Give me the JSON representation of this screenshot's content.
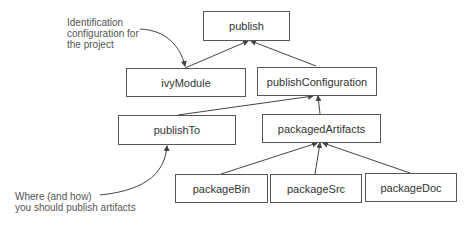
{
  "diagram": {
    "nodes": [
      {
        "id": "publish",
        "label": "publish"
      },
      {
        "id": "ivyModule",
        "label": "ivyModule"
      },
      {
        "id": "publishConfiguration",
        "label": "publishConfiguration"
      },
      {
        "id": "publishTo",
        "label": "publishTo"
      },
      {
        "id": "packagedArtifacts",
        "label": "packagedArtifacts"
      },
      {
        "id": "packageBin",
        "label": "packageBin"
      },
      {
        "id": "packageSrc",
        "label": "packageSrc"
      },
      {
        "id": "packageDoc",
        "label": "packageDoc"
      }
    ],
    "edges": [
      {
        "from": "ivyModule",
        "to": "publish"
      },
      {
        "from": "publishConfiguration",
        "to": "publish"
      },
      {
        "from": "publishTo",
        "to": "publishConfiguration"
      },
      {
        "from": "packagedArtifacts",
        "to": "publishConfiguration"
      },
      {
        "from": "packageBin",
        "to": "packagedArtifacts"
      },
      {
        "from": "packageSrc",
        "to": "packagedArtifacts"
      },
      {
        "from": "packageDoc",
        "to": "packagedArtifacts"
      }
    ],
    "annotations": [
      {
        "target": "ivyModule",
        "lines": [
          "Identification",
          "configuration for",
          "the project"
        ]
      },
      {
        "target": "publishTo",
        "lines": [
          "Where (and how)",
          "you should publish artifacts"
        ]
      }
    ],
    "colors": {
      "line": "#444444",
      "box_border": "#555555",
      "text": "#333333",
      "note_text": "#555555"
    }
  }
}
